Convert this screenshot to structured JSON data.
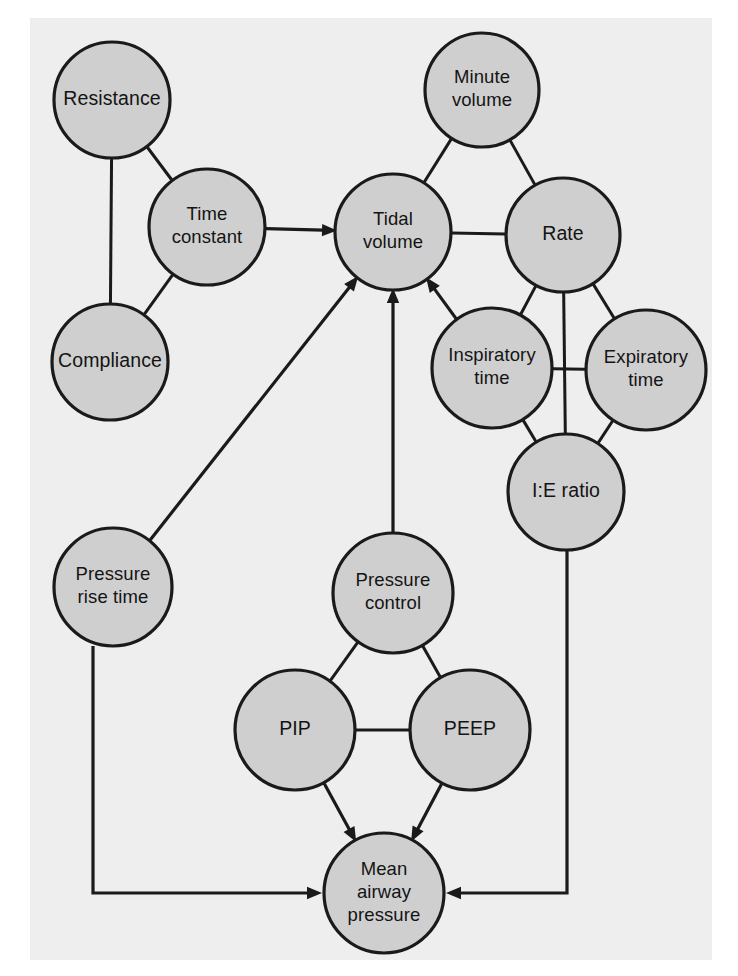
{
  "figure": {
    "panel_background": "#eeeeee",
    "node_fill": "#cfcfcf",
    "node_stroke": "#1a1a1a",
    "page_background": "#ffffff"
  },
  "nodes": [
    {
      "id": "resistance",
      "label_lines": [
        "Resistance"
      ],
      "cx": 112,
      "cy": 100,
      "r": 58
    },
    {
      "id": "time-constant",
      "label_lines": [
        "Time",
        "constant"
      ],
      "cx": 207,
      "cy": 227,
      "r": 58
    },
    {
      "id": "compliance",
      "label_lines": [
        "Compliance"
      ],
      "cx": 110,
      "cy": 362,
      "r": 58
    },
    {
      "id": "tidal-volume",
      "label_lines": [
        "Tidal",
        "volume"
      ],
      "cx": 393,
      "cy": 232,
      "r": 58
    },
    {
      "id": "minute-volume",
      "label_lines": [
        "Minute",
        "volume"
      ],
      "cx": 482,
      "cy": 90,
      "r": 57
    },
    {
      "id": "rate",
      "label_lines": [
        "Rate"
      ],
      "cx": 563,
      "cy": 235,
      "r": 57
    },
    {
      "id": "inspiratory-time",
      "label_lines": [
        "Inspiratory",
        "time"
      ],
      "cx": 492,
      "cy": 368,
      "r": 60
    },
    {
      "id": "expiratory-time",
      "label_lines": [
        "Expiratory",
        "time"
      ],
      "cx": 646,
      "cy": 370,
      "r": 60
    },
    {
      "id": "ie-ratio",
      "label_lines": [
        "I:E ratio"
      ],
      "cx": 566,
      "cy": 492,
      "r": 58
    },
    {
      "id": "pressure-rise-time",
      "label_lines": [
        "Pressure",
        "rise time"
      ],
      "cx": 113,
      "cy": 587,
      "r": 59
    },
    {
      "id": "pressure-control",
      "label_lines": [
        "Pressure",
        "control"
      ],
      "cx": 393,
      "cy": 593,
      "r": 60
    },
    {
      "id": "pip",
      "label_lines": [
        "PIP"
      ],
      "cx": 295,
      "cy": 730,
      "r": 60
    },
    {
      "id": "peep",
      "label_lines": [
        "PEEP"
      ],
      "cx": 470,
      "cy": 730,
      "r": 60
    },
    {
      "id": "mean-airway-pressure",
      "label_lines": [
        "Mean",
        "airway",
        "pressure"
      ],
      "cx": 384,
      "cy": 893,
      "r": 60
    }
  ],
  "edges": [
    {
      "id": "resistance-time-constant",
      "from": "resistance",
      "to": "time-constant",
      "kind": "line"
    },
    {
      "id": "resistance-compliance",
      "from": "resistance",
      "to": "compliance",
      "kind": "line"
    },
    {
      "id": "compliance-time-constant",
      "from": "compliance",
      "to": "time-constant",
      "kind": "line"
    },
    {
      "id": "time-constant-tidal-volume",
      "from": "time-constant",
      "to": "tidal-volume",
      "kind": "arrow"
    },
    {
      "id": "minute-volume-tidal-volume",
      "from": "minute-volume",
      "to": "tidal-volume",
      "kind": "line"
    },
    {
      "id": "minute-volume-rate",
      "from": "minute-volume",
      "to": "rate",
      "kind": "line"
    },
    {
      "id": "tidal-volume-rate",
      "from": "tidal-volume",
      "to": "rate",
      "kind": "line"
    },
    {
      "id": "rate-inspiratory-time",
      "from": "rate",
      "to": "inspiratory-time",
      "kind": "line"
    },
    {
      "id": "rate-expiratory-time",
      "from": "rate",
      "to": "expiratory-time",
      "kind": "line"
    },
    {
      "id": "rate-ie-ratio",
      "from": "rate",
      "to": "ie-ratio",
      "kind": "line"
    },
    {
      "id": "inspiratory-expiratory",
      "from": "inspiratory-time",
      "to": "expiratory-time",
      "kind": "line"
    },
    {
      "id": "inspiratory-ie-ratio",
      "from": "inspiratory-time",
      "to": "ie-ratio",
      "kind": "line"
    },
    {
      "id": "expiratory-ie-ratio",
      "from": "expiratory-time",
      "to": "ie-ratio",
      "kind": "line"
    },
    {
      "id": "inspiratory-time-tidal-volume",
      "from": "inspiratory-time",
      "to": "tidal-volume",
      "kind": "arrow"
    },
    {
      "id": "pressure-rise-time-tidal-volume",
      "from": "pressure-rise-time",
      "to": "tidal-volume",
      "kind": "arrow"
    },
    {
      "id": "pressure-control-tidal-volume",
      "from": "pressure-control",
      "to": "tidal-volume",
      "kind": "arrow"
    },
    {
      "id": "pressure-control-pip",
      "from": "pressure-control",
      "to": "pip",
      "kind": "line"
    },
    {
      "id": "pressure-control-peep",
      "from": "pressure-control",
      "to": "peep",
      "kind": "line"
    },
    {
      "id": "pip-peep",
      "from": "pip",
      "to": "peep",
      "kind": "line"
    },
    {
      "id": "pip-mean-airway-pressure",
      "from": "pip",
      "to": "mean-airway-pressure",
      "kind": "arrow"
    },
    {
      "id": "peep-mean-airway-pressure",
      "from": "peep",
      "to": "mean-airway-pressure",
      "kind": "arrow"
    },
    {
      "id": "pressure-rise-time-mean-airway-pressure",
      "from": "pressure-rise-time",
      "to": "mean-airway-pressure",
      "kind": "elbow-arrow-left"
    },
    {
      "id": "ie-ratio-mean-airway-pressure",
      "from": "ie-ratio",
      "to": "mean-airway-pressure",
      "kind": "elbow-arrow-right"
    }
  ],
  "elbows": {
    "pressure-rise-time-mean-airway-pressure": {
      "x": 93,
      "y_corner": 893
    },
    "ie-ratio-mean-airway-pressure": {
      "x": 567,
      "y_corner": 893
    }
  }
}
